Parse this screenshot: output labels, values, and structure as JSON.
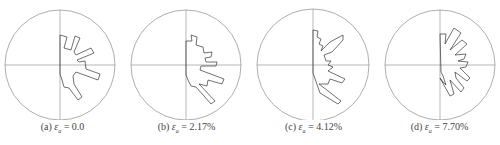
{
  "figure": {
    "type": "rose-diagram-set",
    "stroke_color": "#333333",
    "axis_color": "#888888",
    "circle_color": "#999999"
  },
  "panels": [
    {
      "id": "a",
      "label": "(a)",
      "symbol": "ε",
      "subscript": "a",
      "equals": "=",
      "value": "0.0",
      "center": [
        60,
        65
      ],
      "radius": 55,
      "polygon": "60,35 67,37 64,48 71,50 75,36 80,38 74,52 76,55 91,48 94,53 77,60 79,62 85,61 86,69 100,74 98,80 76,72 73,76 74,84 82,97 78,100 69,88 64,87 62,80 60,74"
    },
    {
      "id": "b",
      "label": "(b)",
      "symbol": "ε",
      "subscript": "a",
      "equals": "=",
      "value": "2.17%",
      "center": [
        186,
        65
      ],
      "radius": 55,
      "polygon": "186,41 192,41 191,35 197,37 196,45 203,47 204,53 212,52 211,57 205,58 206,62 217,62 216,66 201,66 200,70 224,79 222,84 208,80 207,86 199,84 215,101 211,104 196,87 191,86 188,80 186,75"
    },
    {
      "id": "c",
      "label": "(c)",
      "symbol": "ε",
      "subscript": "a",
      "equals": "=",
      "value": "4.12%",
      "center": [
        313,
        65
      ],
      "radius": 56,
      "polygon": "313,30 318,31 317,37 321,39 319,44 323,46 321,51 330,42 343,35 343,40 332,52 324,55 326,61 331,61 328,65 333,67 328,71 345,79 342,83 330,79 328,84 319,84 341,101 338,104 320,93 313,73"
    },
    {
      "id": "d",
      "label": "(d)",
      "symbol": "ε",
      "subscript": "a",
      "equals": "=",
      "value": "7.70%",
      "center": [
        440,
        65
      ],
      "radius": 55,
      "polygon": "440,34 446,34 445,44 454,28 461,33 450,50 462,40 467,44 455,55 466,54 464,59 458,61 468,62 466,67 460,68 470,78 467,81 455,72 456,78 464,88 461,92 450,80 454,94 450,96 440,78 443,82 446,85 443,76 441,72"
    }
  ]
}
